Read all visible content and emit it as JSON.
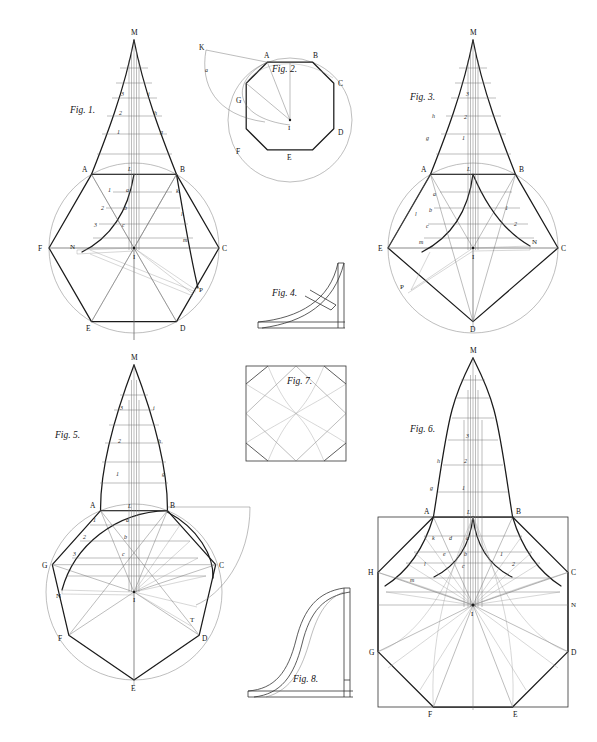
{
  "plate": {
    "title": "Geometric construction plate — spires, domes and polygons",
    "background_color": "#ffffff",
    "ink_color": "#1b1b1b",
    "width": 597,
    "height": 742
  },
  "figures": [
    {
      "id": "fig1",
      "caption": "Fig. 1.",
      "kind": "hexagon-spire-construction",
      "caption_pos": {
        "x": 70,
        "y": 113
      },
      "polygon_sides": 6,
      "center": {
        "x": 134,
        "y": 248,
        "label": "I"
      },
      "radius": 85,
      "apex": {
        "x": 134,
        "y": 40,
        "label": "M"
      },
      "vertex_labels": [
        "A",
        "B",
        "C",
        "D",
        "E",
        "F"
      ],
      "extra_labels": [
        "N",
        "P"
      ],
      "centerline_numbers": [
        "3",
        "2",
        "1"
      ],
      "profile_letters_upper": [
        "i",
        "h",
        "g"
      ],
      "profile_letters_lower": [
        "k",
        "l",
        "m"
      ],
      "inner_letters": [
        "a",
        "b",
        "c"
      ],
      "inner_numbers": [
        "1",
        "2",
        "3"
      ],
      "base_letter": "L"
    },
    {
      "id": "fig2",
      "caption": "Fig. 2.",
      "kind": "regular-octagon-in-circle",
      "caption_pos": {
        "x": 272,
        "y": 72
      },
      "polygon_sides": 8,
      "center": {
        "x": 290,
        "y": 120,
        "label": "I"
      },
      "radius": 62,
      "vertex_labels": [
        "A",
        "B",
        "C",
        "D",
        "E",
        "F",
        "G"
      ],
      "extra_labels": [
        "K"
      ],
      "arc_letter": "a"
    },
    {
      "id": "fig3",
      "caption": "Fig. 3.",
      "kind": "hexagon-spire-construction",
      "caption_pos": {
        "x": 410,
        "y": 100
      },
      "polygon_sides": 6,
      "center": {
        "x": 473,
        "y": 248,
        "label": "I"
      },
      "radius": 85,
      "apex": {
        "x": 473,
        "y": 40,
        "label": "M"
      },
      "vertex_labels": [
        "A",
        "B",
        "C",
        "D",
        "E",
        "F"
      ],
      "extra_labels": [
        "N",
        "P"
      ],
      "centerline_numbers": [
        "3",
        "2",
        "1"
      ],
      "profile_letters_upper": [
        "i",
        "h",
        "g"
      ],
      "profile_letters_lower": [
        "k",
        "l",
        "m"
      ],
      "inner_letters": [
        "a",
        "b",
        "c",
        "d",
        "e"
      ],
      "inner_numbers": [
        "1",
        "2",
        "3"
      ],
      "base_letter": "L"
    },
    {
      "id": "fig4",
      "caption": "Fig. 4.",
      "kind": "concave-bracket-profile",
      "caption_pos": {
        "x": 272,
        "y": 296
      },
      "box": {
        "x": 258,
        "y": 263,
        "w": 90,
        "h": 65
      }
    },
    {
      "id": "fig5",
      "caption": "Fig. 5.",
      "kind": "heptagon-ogive-construction",
      "caption_pos": {
        "x": 55,
        "y": 438
      },
      "polygon_sides": 7,
      "center": {
        "x": 134,
        "y": 592,
        "label": "I"
      },
      "radius": 88,
      "apex": {
        "x": 134,
        "y": 365,
        "label": "M"
      },
      "vertex_labels": [
        "A",
        "B",
        "C",
        "D",
        "E",
        "F",
        "G"
      ],
      "extra_labels": [
        "N",
        "T"
      ],
      "centerline_numbers": [
        "3",
        "2",
        "1"
      ],
      "profile_letters_upper": [
        "i",
        "h",
        "g"
      ],
      "inner_letters": [
        "a",
        "b",
        "c"
      ],
      "inner_numbers": [
        "1",
        "2",
        "3"
      ],
      "base_letter": "L"
    },
    {
      "id": "fig6",
      "caption": "Fig. 6.",
      "kind": "octagon-ogee-dome-construction",
      "caption_pos": {
        "x": 410,
        "y": 432
      },
      "polygon_sides": 8,
      "center": {
        "x": 473,
        "y": 605,
        "label": "I"
      },
      "radius": 100,
      "apex": {
        "x": 473,
        "y": 358,
        "label": "M"
      },
      "vertex_labels": [
        "A",
        "B",
        "C",
        "D",
        "E",
        "F",
        "G",
        "H"
      ],
      "extra_labels": [
        "N"
      ],
      "centerline_numbers": [
        "3",
        "2",
        "1"
      ],
      "profile_letters_upper": [
        "h",
        "g"
      ],
      "inner_letters": [
        "a",
        "b",
        "c",
        "d",
        "e",
        "k",
        "l",
        "m"
      ],
      "inner_numbers": [
        "1",
        "2"
      ],
      "base_letter": "L"
    },
    {
      "id": "fig7",
      "caption": "Fig. 7.",
      "kind": "square-with-rotated-square-and-petals",
      "caption_pos": {
        "x": 287,
        "y": 384
      },
      "box": {
        "x": 246,
        "y": 366,
        "w": 100,
        "h": 95
      }
    },
    {
      "id": "fig8",
      "caption": "Fig. 8.",
      "kind": "ogee-s-curve-profile",
      "caption_pos": {
        "x": 293,
        "y": 682
      },
      "box": {
        "x": 248,
        "y": 588,
        "w": 105,
        "h": 110
      }
    }
  ]
}
